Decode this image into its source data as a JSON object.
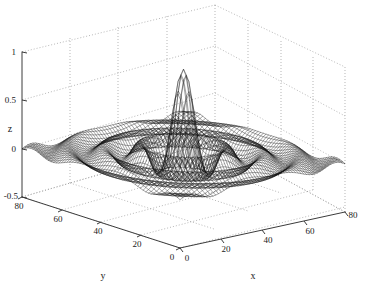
{
  "figure": {
    "background_color": "#ffffff",
    "mesh_color": "#000000",
    "grid_color": "#9a9a9a",
    "axis_color": "#3c3c3c",
    "text_color": "#1a1a1a"
  },
  "axes": {
    "z": {
      "label": "z",
      "ticks": [
        "1",
        "0.5",
        "0",
        "-0.5"
      ],
      "tick_values": [
        1,
        0.5,
        0,
        -0.5
      ],
      "range": [
        -0.5,
        1
      ]
    },
    "y": {
      "label": "y",
      "ticks": [
        "80",
        "60",
        "40",
        "20",
        "0"
      ],
      "tick_values": [
        80,
        60,
        40,
        20,
        0
      ],
      "range": [
        0,
        80
      ]
    },
    "x": {
      "label": "x",
      "ticks": [
        "0",
        "20",
        "40",
        "60",
        "80"
      ],
      "tick_values": [
        0,
        20,
        40,
        60,
        80
      ],
      "range": [
        0,
        80
      ]
    }
  },
  "chart_data": {
    "type": "surface",
    "title": "",
    "xlabel": "x",
    "ylabel": "y",
    "zlabel": "z",
    "xlim": [
      0,
      80
    ],
    "ylim": [
      0,
      80
    ],
    "zlim": [
      -0.5,
      1
    ],
    "xticks": [
      0,
      20,
      40,
      60,
      80
    ],
    "yticks": [
      0,
      20,
      40,
      60,
      80
    ],
    "zticks": [
      -0.5,
      0,
      0.5,
      1
    ],
    "grid": true,
    "legend": "none",
    "style": "wireframe-mesh",
    "view": {
      "azimuth": -37.5,
      "elevation": 30
    },
    "function": "z = sin(r)/r  with  r = sqrt((x-40)^2 + (y-40)^2)/2",
    "grid_size": {
      "nx": 61,
      "ny": 61
    },
    "peak": {
      "x": 40,
      "y": 40,
      "z": 0.9
    },
    "ripple_radii": [
      0,
      13,
      26,
      39
    ],
    "ripple_amplitudes": [
      0.9,
      -0.21,
      0.13,
      -0.09
    ],
    "corner_value": 0.02,
    "radial_profile": {
      "r": [
        0,
        2,
        4,
        6,
        8,
        10,
        12,
        14,
        16,
        18,
        20,
        24,
        28,
        32,
        36,
        40,
        44,
        50,
        56
      ],
      "z": [
        0.9,
        0.72,
        0.38,
        0.05,
        -0.14,
        -0.19,
        -0.11,
        0.01,
        0.1,
        0.12,
        0.07,
        -0.05,
        -0.08,
        0.0,
        0.07,
        0.05,
        -0.03,
        -0.05,
        0.04
      ]
    }
  }
}
